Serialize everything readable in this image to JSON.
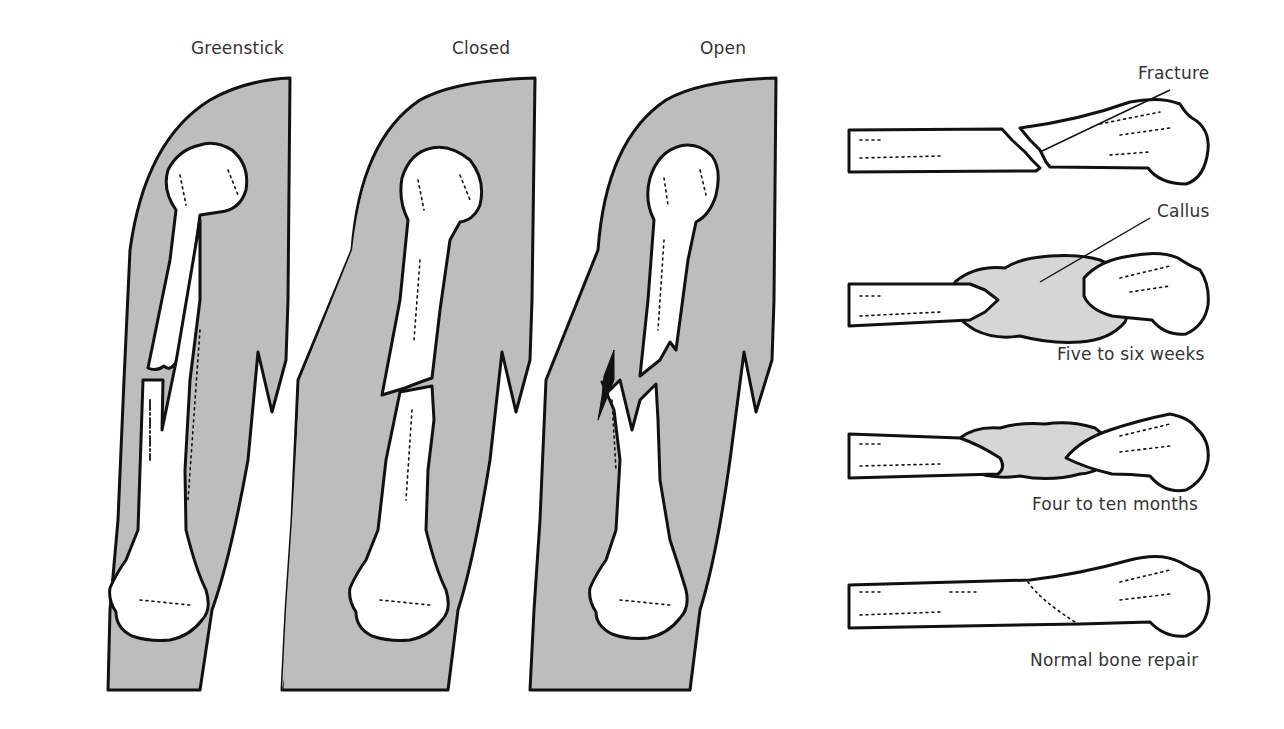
{
  "figure": {
    "fracture_types": {
      "title_greenstick": "Greenstick",
      "title_closed": "Closed",
      "title_open": "Open"
    },
    "healing_stages": {
      "fracture_label": "Fracture",
      "callus_label": "Callus",
      "stage_1": "Five to six weeks",
      "stage_2": "Four to ten months",
      "stage_3": "Normal bone repair"
    },
    "colors": {
      "soft_tissue_fill": "#bdbdbd",
      "callus_fill": "#d6d6d6",
      "outline": "#111111",
      "bone_fill": "#ffffff",
      "label_text": "#333333"
    }
  }
}
